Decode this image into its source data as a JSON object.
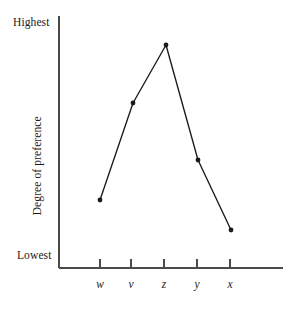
{
  "chart_data": {
    "type": "line",
    "title": "",
    "subtitle": "",
    "xlabel": "",
    "ylabel": "Degree of preference",
    "categories": [
      "w",
      "v",
      "z",
      "y",
      "x"
    ],
    "values": [
      3.15,
      6.55,
      8.85,
      4.28,
      1.5
    ],
    "series": [
      {
        "name": "preference",
        "values": [
          3.15,
          6.55,
          8.85,
          4.28,
          1.5
        ]
      }
    ],
    "ylim": [
      0,
      10
    ],
    "y_tick_labels": [
      "Lowest",
      "Highest"
    ],
    "y_axis_min_label": "Lowest",
    "y_axis_max_label": "Highest",
    "grid": false,
    "legend": false,
    "legend_position": "none",
    "marker": "filled-circle",
    "line_color": "#1a1a1a",
    "marker_color": "#1a1a1a",
    "axis_color": "#4a4a4a",
    "background_color": "#ffffff",
    "annotations": []
  },
  "axes": {
    "y_top_label": "Highest",
    "y_bottom_label": "Lowest",
    "y_title": "Degree of preference"
  },
  "x_ticks": [
    {
      "label": "w",
      "x": 100
    },
    {
      "label": "v",
      "x": 131
    },
    {
      "label": "z",
      "x": 164
    },
    {
      "label": "y",
      "x": 197
    },
    {
      "label": "x",
      "x": 230
    }
  ],
  "points": [
    {
      "label": "w",
      "x": 100,
      "y": 200
    },
    {
      "label": "v",
      "x": 133,
      "y": 103
    },
    {
      "label": "z",
      "x": 166,
      "y": 45
    },
    {
      "label": "y",
      "x": 198,
      "y": 160
    },
    {
      "label": "x",
      "x": 231,
      "y": 230
    }
  ],
  "geometry": {
    "axis_x": 59,
    "axis_y": 268,
    "y_axis_top": 16,
    "x_axis_right": 283,
    "tick_length": 9
  }
}
